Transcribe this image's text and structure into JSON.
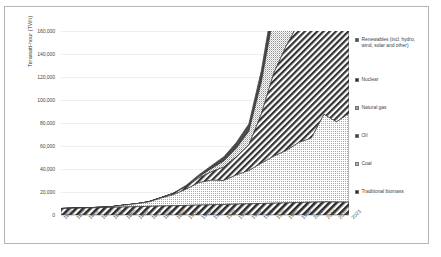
{
  "chart_data": {
    "type": "area",
    "stacked": true,
    "title": "",
    "xlabel": "",
    "ylabel": "Terawatt-hour (TWh)",
    "ylim": [
      0,
      160000
    ],
    "yticks": [
      "0",
      "20,000",
      "40,000",
      "60,000",
      "80,000",
      "100,000",
      "120,000",
      "140,000",
      "160,000"
    ],
    "ytick_values": [
      0,
      20000,
      40000,
      60000,
      80000,
      100000,
      120000,
      140000,
      160000
    ],
    "grid": true,
    "legend_position": "right",
    "x": [
      1800,
      1810,
      1820,
      1830,
      1840,
      1850,
      1860,
      1870,
      1880,
      1890,
      1900,
      1910,
      1920,
      1930,
      1940,
      1950,
      1960,
      1970,
      1980,
      1990,
      2000,
      2010,
      2020,
      2021
    ],
    "categories": [
      "1800",
      "1810",
      "1820",
      "1830",
      "1840",
      "1850",
      "1860",
      "1870",
      "1880",
      "1890",
      "1900",
      "1910",
      "1920",
      "1930",
      "1940",
      "1950",
      "1960",
      "1970",
      "1980",
      "1990",
      "2000",
      "2010",
      "2020",
      "2021"
    ],
    "series": [
      {
        "name": "Traditional biomass",
        "pattern": "diagonal-hatch-dark",
        "values": [
          5556,
          5833,
          6111,
          6389,
          6667,
          6944,
          7222,
          7500,
          7778,
          8056,
          8333,
          8611,
          8889,
          9167,
          9444,
          9722,
          10000,
          10278,
          10556,
          10833,
          11111,
          11389,
          11250,
          11111
        ]
      },
      {
        "name": "Coal",
        "pattern": "fine-dots-light",
        "values": [
          97,
          128,
          151,
          278,
          526,
          1639,
          2500,
          3889,
          6944,
          9722,
          14167,
          19444,
          21389,
          20833,
          25278,
          28889,
          35000,
          40833,
          45556,
          52222,
          55833,
          76111,
          69722,
          77222
        ]
      },
      {
        "name": "Oil",
        "pattern": "diagonal-hatch-dense",
        "values": [
          0,
          0,
          0,
          0,
          0,
          0,
          0,
          139,
          417,
          1111,
          2222,
          4167,
          7222,
          11667,
          15833,
          22222,
          42778,
          72500,
          91111,
          104167,
          125556,
          145833,
          139167,
          146667
        ]
      },
      {
        "name": "Natural gas",
        "pattern": "fine-dots-mid",
        "values": [
          0,
          0,
          0,
          0,
          0,
          0,
          0,
          0,
          0,
          0,
          278,
          972,
          2778,
          5278,
          7500,
          11944,
          27778,
          51111,
          70000,
          88889,
          109167,
          125000,
          131944,
          136944
        ]
      },
      {
        "name": "Nuclear",
        "pattern": "solid-dark",
        "values": [
          0,
          0,
          0,
          0,
          0,
          0,
          0,
          0,
          0,
          0,
          0,
          0,
          0,
          0,
          0,
          0,
          333,
          2222,
          8056,
          16944,
          21944,
          22500,
          20278,
          21389
        ]
      },
      {
        "name": "Renewables (incl. hydro, wind, solar and other)",
        "pattern": "solid-gray",
        "values": [
          0,
          0,
          0,
          0,
          0,
          0,
          0,
          0,
          0,
          278,
          833,
          1667,
          2500,
          3611,
          5000,
          6389,
          9722,
          13056,
          17500,
          21667,
          26389,
          33333,
          45833,
          49722
        ]
      }
    ]
  },
  "legend": {
    "items": [
      {
        "label": "Renewables (incl. hydro, wind, solar and other)",
        "pattern": "solid-gray"
      },
      {
        "label": "Nuclear",
        "pattern": "solid-dark"
      },
      {
        "label": "Natural gas",
        "pattern": "fine-dots-mid"
      },
      {
        "label": "Oil",
        "pattern": "diagonal-hatch-dense"
      },
      {
        "label": "Coal",
        "pattern": "fine-dots-light"
      },
      {
        "label": "Traditional biomass",
        "pattern": "diagonal-hatch-dark"
      }
    ]
  }
}
